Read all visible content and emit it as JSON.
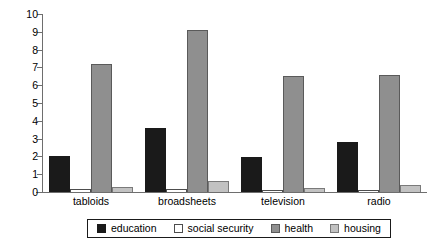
{
  "chart_data": {
    "type": "bar",
    "title": "",
    "subtitle": "",
    "xlabel": "",
    "ylabel": "",
    "ylim": [
      0,
      10
    ],
    "yticks": [
      0,
      1,
      2,
      3,
      4,
      5,
      6,
      7,
      8,
      9,
      10
    ],
    "ytick_labels": [
      "0",
      "1",
      "2",
      "3",
      "4",
      "5",
      "6",
      "7",
      "8",
      "9",
      "10"
    ],
    "grid": false,
    "legend_position": "bottom",
    "categories": [
      "tabloids",
      "broadsheets",
      "television",
      "radio"
    ],
    "series": [
      {
        "name": "education",
        "color": "#1a1a1a",
        "values": [
          2.05,
          3.6,
          1.95,
          2.8
        ]
      },
      {
        "name": "social security",
        "color": "#ffffff",
        "values": [
          0.15,
          0.15,
          0.1,
          0.1
        ]
      },
      {
        "name": "health",
        "color": "#8f8f8f",
        "values": [
          7.2,
          9.1,
          6.5,
          6.6
        ]
      },
      {
        "name": "housing",
        "color": "#c2c2c2",
        "values": [
          0.3,
          0.6,
          0.2,
          0.4
        ]
      }
    ]
  }
}
